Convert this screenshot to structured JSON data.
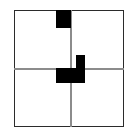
{
  "figure": {
    "canvas": {
      "width": 138,
      "height": 139,
      "background": "#ffffff"
    },
    "colors": {
      "frame_border": "#2b2b2b",
      "axis_line": "#8c8c8c",
      "block_fill": "#000000",
      "background": "#ffffff"
    },
    "frame": {
      "name": "outer-square-border",
      "x": 14,
      "y": 10,
      "width": 110,
      "height": 117,
      "stroke_width": 1.5,
      "color": "#2b2b2b"
    },
    "axes": {
      "vertical": {
        "name": "vertical-axis-line",
        "x": 70,
        "y": 10,
        "length": 117,
        "color": "#8c8c8c",
        "stroke_width": 1.5
      },
      "horizontal": {
        "name": "horizontal-axis-line",
        "x": 14,
        "y": 68,
        "length": 110,
        "color": "#8c8c8c",
        "stroke_width": 1.5
      }
    },
    "blocks": [
      {
        "name": "top-black-square",
        "quadrant": "upper-left-edge",
        "x": 56,
        "y": 10,
        "width": 15,
        "height": 18,
        "fill": "#000000"
      },
      {
        "name": "center-block-upper-arm",
        "quadrant": "upper-right",
        "x": 76,
        "y": 55,
        "width": 9,
        "height": 14,
        "fill": "#000000"
      },
      {
        "name": "center-block-lower-bar",
        "quadrant": "lower-center",
        "x": 56,
        "y": 68,
        "width": 29,
        "height": 15,
        "fill": "#000000"
      }
    ]
  }
}
